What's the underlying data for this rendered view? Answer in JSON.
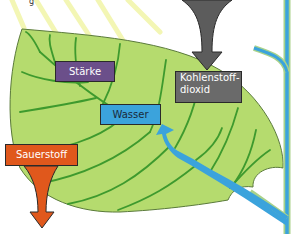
{
  "diagram": {
    "title_fragment": "g",
    "labels": {
      "staerke": "Stärke",
      "wasser": "Wasser",
      "co2_line1": "Kohlenstoff-",
      "co2_line2": "dioxid",
      "sauerstoff": "Sauerstoff"
    },
    "colors": {
      "leaf": "#b5db6e",
      "leaf_edge": "#5a7a3a",
      "vein": "#3e9a2e",
      "water": "#3ba3dc",
      "staerke_box": "#6b4f8a",
      "co2_box": "#6a6a6a",
      "co2_arrow": "#5c5c5c",
      "sauerstoff_box": "#e0581c",
      "sunlight": "#f4f7b0"
    }
  }
}
